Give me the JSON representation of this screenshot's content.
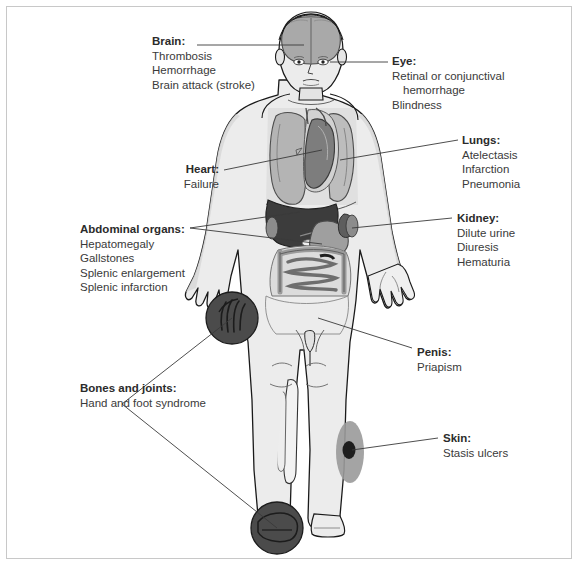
{
  "callouts": [
    {
      "id": "brain",
      "head": "Brain:",
      "items": [
        "Thrombosis",
        "Hemorrhage",
        "Brain attack (stroke)"
      ],
      "side": "left"
    },
    {
      "id": "eye",
      "head": "Eye:",
      "items": [
        "Retinal or conjunctival",
        "hemorrhage",
        "Blindness"
      ],
      "indent": [
        false,
        true,
        false
      ],
      "side": "right"
    },
    {
      "id": "heart",
      "head": "Heart:",
      "items": [
        "Failure"
      ],
      "side": "left"
    },
    {
      "id": "lungs",
      "head": "Lungs:",
      "items": [
        "Atelectasis",
        "Infarction",
        "Pneumonia"
      ],
      "side": "right"
    },
    {
      "id": "abdominal-organs",
      "head": "Abdominal organs:",
      "items": [
        "Hepatomegaly",
        "Gallstones",
        "Splenic enlargement",
        "Splenic infarction"
      ],
      "side": "left"
    },
    {
      "id": "kidney",
      "head": "Kidney:",
      "items": [
        "Dilute urine",
        "Diuresis",
        "Hematuria"
      ],
      "side": "right"
    },
    {
      "id": "penis",
      "head": "Penis:",
      "items": [
        "Priapism"
      ],
      "side": "right"
    },
    {
      "id": "bones-and-joints",
      "head": "Bones and joints:",
      "items": [
        "Hand and foot syndrome"
      ],
      "side": "left"
    },
    {
      "id": "skin",
      "head": "Skin:",
      "items": [
        "Stasis ulcers"
      ],
      "side": "right"
    }
  ],
  "colors": {
    "border": "#c8c8c8",
    "outline": "#1a1a1a",
    "skin": "#eeeeee",
    "body_shade": "#e3e3e3",
    "lung": "#b4b4b4",
    "heart": "#7d7d7d",
    "liver": "#3c3c3c",
    "stomach": "#d4d4d4",
    "intestine": "#a8a8a8",
    "brain": "#a9a9a9",
    "marker_circle": "#4b4b4b",
    "skin_lesion": "#1e1e1e",
    "lesion_halo": "#9a9a9a",
    "leader_line": "#3a3a3a",
    "text": "#2b2b2b"
  }
}
